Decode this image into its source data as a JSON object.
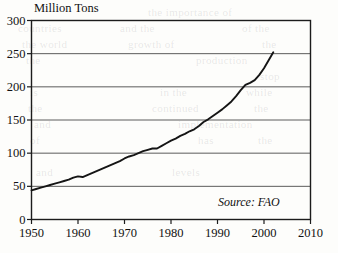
{
  "chart_data": {
    "type": "line",
    "title": "",
    "xlabel": "",
    "ylabel": "Million Tons",
    "ylim": [
      0,
      300
    ],
    "xlim": [
      1950,
      2010
    ],
    "grid": true,
    "legend": null,
    "yticks": [
      0,
      50,
      100,
      150,
      200,
      250,
      300
    ],
    "xticks": [
      1950,
      1960,
      1970,
      1980,
      1990,
      2000,
      2010
    ],
    "annotations": [
      {
        "text": "Source: FAO",
        "x": 2000,
        "y": 25,
        "style": "italic"
      }
    ],
    "series": [
      {
        "name": "World production",
        "x": [
          1950,
          1951,
          1952,
          1953,
          1954,
          1955,
          1956,
          1957,
          1958,
          1959,
          1960,
          1961,
          1962,
          1963,
          1964,
          1965,
          1966,
          1967,
          1968,
          1969,
          1970,
          1971,
          1972,
          1973,
          1974,
          1975,
          1976,
          1977,
          1978,
          1979,
          1980,
          1981,
          1982,
          1983,
          1984,
          1985,
          1986,
          1987,
          1988,
          1989,
          1990,
          1991,
          1992,
          1993,
          1994,
          1995,
          1996,
          1997,
          1998,
          1999,
          2000,
          2001,
          2002
        ],
        "values": [
          44,
          46,
          48,
          50,
          52,
          54,
          56,
          58,
          60,
          63,
          65,
          64,
          67,
          70,
          73,
          76,
          79,
          82,
          85,
          88,
          92,
          95,
          97,
          100,
          103,
          105,
          107,
          107,
          111,
          115,
          119,
          122,
          126,
          129,
          133,
          136,
          141,
          147,
          151,
          156,
          161,
          166,
          172,
          178,
          186,
          195,
          203,
          206,
          210,
          218,
          228,
          240,
          252
        ]
      }
    ]
  },
  "bleed_text": [
    {
      "text": "the importance of",
      "x": 148,
      "y": 6
    },
    {
      "text": "countries",
      "x": 18,
      "y": 22
    },
    {
      "text": "and the",
      "x": 120,
      "y": 22
    },
    {
      "text": "of the",
      "x": 242,
      "y": 22
    },
    {
      "text": "the world",
      "x": 22,
      "y": 38
    },
    {
      "text": "growth of",
      "x": 128,
      "y": 38
    },
    {
      "text": "the",
      "x": 262,
      "y": 38
    },
    {
      "text": "the",
      "x": 26,
      "y": 54
    },
    {
      "text": "production",
      "x": 196,
      "y": 54
    },
    {
      "text": "stop",
      "x": 260,
      "y": 70
    },
    {
      "text": "is",
      "x": 30,
      "y": 86
    },
    {
      "text": "in the",
      "x": 160,
      "y": 86
    },
    {
      "text": "while",
      "x": 246,
      "y": 86
    },
    {
      "text": "the",
      "x": 28,
      "y": 102
    },
    {
      "text": "continued",
      "x": 152,
      "y": 102
    },
    {
      "text": "the",
      "x": 254,
      "y": 102
    },
    {
      "text": "and",
      "x": 34,
      "y": 118
    },
    {
      "text": "implementation",
      "x": 178,
      "y": 118
    },
    {
      "text": "of",
      "x": 30,
      "y": 134
    },
    {
      "text": "has",
      "x": 198,
      "y": 134
    },
    {
      "text": "the",
      "x": 258,
      "y": 134
    },
    {
      "text": "and",
      "x": 36,
      "y": 166
    },
    {
      "text": "levels",
      "x": 172,
      "y": 166
    }
  ]
}
